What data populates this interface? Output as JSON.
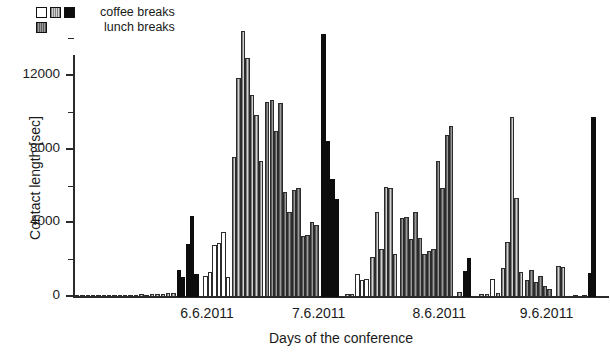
{
  "legend": {
    "items": [
      {
        "label": "coffee breaks",
        "swatches": [
          "#ffffff",
          "#d2d2d2",
          "#0d0d0d"
        ]
      },
      {
        "label": "lunch breaks",
        "swatches": [
          "#9a9a9a"
        ]
      }
    ]
  },
  "axes": {
    "y_title": "Contact length [sec]",
    "x_title": "Days of the conference",
    "y_major_ticks": [
      0,
      4000,
      8000,
      12000
    ],
    "y_minor_ticks": [
      2000,
      6000,
      10000,
      14000
    ],
    "y_tick_labels": [
      "0",
      "4000",
      "8000",
      "12000"
    ],
    "x_tick_labels": [
      "6.6.2011",
      "7.6.2011",
      "8.6.2011",
      "9.6.2011"
    ]
  },
  "chart_data": {
    "type": "bar",
    "title": "",
    "xlabel": "Days of the conference",
    "ylabel": "Contact length [sec]",
    "ylim": [
      0,
      15000
    ],
    "grid": false,
    "legend_position": "top-left",
    "series": [
      {
        "name": "coffee breaks (white)",
        "color": "#ffffff"
      },
      {
        "name": "coffee breaks (light gray)",
        "color": "#d2d2d2"
      },
      {
        "name": "coffee breaks (black)",
        "color": "#0d0d0d"
      },
      {
        "name": "lunch breaks",
        "color": "#9a9a9a"
      }
    ],
    "note": "Sorted contact-length bars grouped by day and by break type; x is an ordinal contact index, not time.",
    "bars": [
      {
        "x": 2,
        "value": 60,
        "group": "light"
      },
      {
        "x": 8,
        "value": 70,
        "group": "light"
      },
      {
        "x": 14,
        "value": 60,
        "group": "light"
      },
      {
        "x": 20,
        "value": 80,
        "group": "light"
      },
      {
        "x": 26,
        "value": 60,
        "group": "light"
      },
      {
        "x": 32,
        "value": 70,
        "group": "light"
      },
      {
        "x": 38,
        "value": 90,
        "group": "light"
      },
      {
        "x": 44,
        "value": 70,
        "group": "light"
      },
      {
        "x": 50,
        "value": 110,
        "group": "light"
      },
      {
        "x": 56,
        "value": 90,
        "group": "light"
      },
      {
        "x": 62,
        "value": 130,
        "group": "light"
      },
      {
        "x": 68,
        "value": 110,
        "group": "light"
      },
      {
        "x": 74,
        "value": 150,
        "group": "light"
      },
      {
        "x": 80,
        "value": 130,
        "group": "light"
      },
      {
        "x": 86,
        "value": 170,
        "group": "light"
      },
      {
        "x": 92,
        "value": 150,
        "group": "light"
      },
      {
        "x": 98,
        "value": 190,
        "group": "light"
      },
      {
        "x": 104,
        "value": 200,
        "group": "light"
      },
      {
        "x": 110,
        "value": 220,
        "group": "light"
      },
      {
        "x": 116,
        "value": 1450,
        "group": "black"
      },
      {
        "x": 121,
        "value": 1100,
        "group": "black"
      },
      {
        "x": 126,
        "value": 2900,
        "group": "black"
      },
      {
        "x": 131,
        "value": 4400,
        "group": "black"
      },
      {
        "x": 136,
        "value": 1250,
        "group": "black"
      },
      {
        "x": 146,
        "value": 1150,
        "group": "white"
      },
      {
        "x": 151,
        "value": 1350,
        "group": "white"
      },
      {
        "x": 156,
        "value": 2850,
        "group": "white"
      },
      {
        "x": 161,
        "value": 2950,
        "group": "white"
      },
      {
        "x": 166,
        "value": 3550,
        "group": "white"
      },
      {
        "x": 171,
        "value": 1100,
        "group": "white"
      },
      {
        "x": 178,
        "value": 7600,
        "group": "light"
      },
      {
        "x": 183,
        "value": 11900,
        "group": "light"
      },
      {
        "x": 188,
        "value": 14450,
        "group": "light"
      },
      {
        "x": 193,
        "value": 13000,
        "group": "light"
      },
      {
        "x": 198,
        "value": 11000,
        "group": "light"
      },
      {
        "x": 203,
        "value": 9900,
        "group": "light"
      },
      {
        "x": 208,
        "value": 7400,
        "group": "light"
      },
      {
        "x": 215,
        "value": 10600,
        "group": "lunch"
      },
      {
        "x": 220,
        "value": 10700,
        "group": "lunch"
      },
      {
        "x": 225,
        "value": 9000,
        "group": "lunch"
      },
      {
        "x": 230,
        "value": 10550,
        "group": "lunch"
      },
      {
        "x": 235,
        "value": 5700,
        "group": "lunch"
      },
      {
        "x": 240,
        "value": 4600,
        "group": "lunch"
      },
      {
        "x": 245,
        "value": 5800,
        "group": "lunch"
      },
      {
        "x": 250,
        "value": 5900,
        "group": "lunch"
      },
      {
        "x": 255,
        "value": 3300,
        "group": "lunch"
      },
      {
        "x": 260,
        "value": 3350,
        "group": "lunch"
      },
      {
        "x": 265,
        "value": 4100,
        "group": "lunch"
      },
      {
        "x": 270,
        "value": 3900,
        "group": "lunch"
      },
      {
        "x": 278,
        "value": 14300,
        "group": "black"
      },
      {
        "x": 283,
        "value": 8500,
        "group": "black"
      },
      {
        "x": 288,
        "value": 6400,
        "group": "black"
      },
      {
        "x": 293,
        "value": 5300,
        "group": "black"
      },
      {
        "x": 305,
        "value": 140,
        "group": "light"
      },
      {
        "x": 310,
        "value": 150,
        "group": "light"
      },
      {
        "x": 316,
        "value": 1250,
        "group": "white"
      },
      {
        "x": 321,
        "value": 900,
        "group": "white"
      },
      {
        "x": 326,
        "value": 1000,
        "group": "white"
      },
      {
        "x": 333,
        "value": 2200,
        "group": "light"
      },
      {
        "x": 338,
        "value": 4600,
        "group": "light"
      },
      {
        "x": 343,
        "value": 2600,
        "group": "light"
      },
      {
        "x": 348,
        "value": 6000,
        "group": "light"
      },
      {
        "x": 353,
        "value": 5950,
        "group": "light"
      },
      {
        "x": 358,
        "value": 2350,
        "group": "light"
      },
      {
        "x": 366,
        "value": 4300,
        "group": "lunch"
      },
      {
        "x": 371,
        "value": 4350,
        "group": "lunch"
      },
      {
        "x": 376,
        "value": 3150,
        "group": "lunch"
      },
      {
        "x": 381,
        "value": 4600,
        "group": "lunch"
      },
      {
        "x": 386,
        "value": 3200,
        "group": "lunch"
      },
      {
        "x": 391,
        "value": 2350,
        "group": "lunch"
      },
      {
        "x": 396,
        "value": 2500,
        "group": "lunch"
      },
      {
        "x": 401,
        "value": 2600,
        "group": "lunch"
      },
      {
        "x": 406,
        "value": 7400,
        "group": "lunch"
      },
      {
        "x": 411,
        "value": 5900,
        "group": "lunch"
      },
      {
        "x": 416,
        "value": 8800,
        "group": "lunch"
      },
      {
        "x": 421,
        "value": 9300,
        "group": "lunch"
      },
      {
        "x": 430,
        "value": 280,
        "group": "light"
      },
      {
        "x": 437,
        "value": 1400,
        "group": "black"
      },
      {
        "x": 441,
        "value": 2100,
        "group": "black"
      },
      {
        "x": 455,
        "value": 150,
        "group": "light"
      },
      {
        "x": 461,
        "value": 160,
        "group": "light"
      },
      {
        "x": 467,
        "value": 1000,
        "group": "white"
      },
      {
        "x": 473,
        "value": 230,
        "group": "light"
      },
      {
        "x": 479,
        "value": 1600,
        "group": "light"
      },
      {
        "x": 484,
        "value": 3000,
        "group": "light"
      },
      {
        "x": 489,
        "value": 9800,
        "group": "light"
      },
      {
        "x": 494,
        "value": 5400,
        "group": "light"
      },
      {
        "x": 499,
        "value": 1350,
        "group": "light"
      },
      {
        "x": 506,
        "value": 900,
        "group": "lunch"
      },
      {
        "x": 511,
        "value": 1450,
        "group": "lunch"
      },
      {
        "x": 516,
        "value": 800,
        "group": "lunch"
      },
      {
        "x": 521,
        "value": 1150,
        "group": "lunch"
      },
      {
        "x": 526,
        "value": 600,
        "group": "lunch"
      },
      {
        "x": 531,
        "value": 450,
        "group": "lunch"
      },
      {
        "x": 541,
        "value": 1700,
        "group": "light"
      },
      {
        "x": 546,
        "value": 1650,
        "group": "light"
      },
      {
        "x": 560,
        "value": 120,
        "group": "light"
      },
      {
        "x": 570,
        "value": 110,
        "group": "light"
      },
      {
        "x": 580,
        "value": 9800,
        "group": "black"
      },
      {
        "x": 576,
        "value": 1300,
        "group": "black"
      }
    ]
  }
}
